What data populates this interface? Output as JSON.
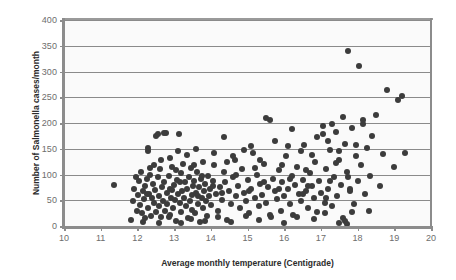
{
  "chart_data": {
    "type": "scatter",
    "title": "",
    "xlabel": "Average monthly temperature (Centigrade)",
    "ylabel": "Number of Salmonella cases/month",
    "xlim": [
      10,
      20
    ],
    "ylim": [
      0,
      400
    ],
    "xticks": [
      10,
      11,
      12,
      13,
      14,
      15,
      16,
      17,
      18,
      19,
      20
    ],
    "yticks": [
      0,
      50,
      100,
      150,
      200,
      250,
      300,
      350,
      400
    ],
    "grid": "horizontal",
    "legend": "none",
    "marker_color": "#3c3c3c",
    "marker_size": 6,
    "gridline_color": "#8a8a8a",
    "axis_color": "#8c8c8c",
    "plot_background": "#fafafa",
    "series": [
      {
        "name": "Monthly Salmonella cases vs temperature",
        "points": [
          [
            11.35,
            80
          ],
          [
            11.82,
            12
          ],
          [
            11.88,
            48
          ],
          [
            11.92,
            72
          ],
          [
            11.95,
            95
          ],
          [
            11.98,
            30
          ],
          [
            12.02,
            60
          ],
          [
            12.05,
            88
          ],
          [
            12.08,
            40
          ],
          [
            12.1,
            105
          ],
          [
            12.12,
            25
          ],
          [
            12.15,
            68
          ],
          [
            12.18,
            52
          ],
          [
            12.2,
            78
          ],
          [
            12.22,
            15
          ],
          [
            12.25,
            92
          ],
          [
            12.28,
            145
          ],
          [
            12.3,
            35
          ],
          [
            12.32,
            62
          ],
          [
            12.35,
            100
          ],
          [
            12.38,
            20
          ],
          [
            12.4,
            55
          ],
          [
            12.42,
            82
          ],
          [
            12.45,
            44
          ],
          [
            12.48,
            70
          ],
          [
            12.5,
            175
          ],
          [
            12.52,
            28
          ],
          [
            12.55,
            95
          ],
          [
            12.58,
            58
          ],
          [
            12.6,
            38
          ],
          [
            12.62,
            110
          ],
          [
            12.65,
            18
          ],
          [
            12.68,
            75
          ],
          [
            12.7,
            48
          ],
          [
            12.72,
            86
          ],
          [
            12.75,
            30
          ],
          [
            12.78,
            180
          ],
          [
            12.8,
            64
          ],
          [
            12.82,
            42
          ],
          [
            12.85,
            98
          ],
          [
            12.88,
            22
          ],
          [
            12.9,
            72
          ],
          [
            12.92,
            55
          ],
          [
            12.95,
            115
          ],
          [
            12.98,
            35
          ],
          [
            13.0,
            80
          ],
          [
            13.02,
            50
          ],
          [
            13.05,
            10
          ],
          [
            13.08,
            90
          ],
          [
            13.1,
            62
          ],
          [
            13.12,
            178
          ],
          [
            13.15,
            45
          ],
          [
            13.18,
            102
          ],
          [
            13.2,
            28
          ],
          [
            13.22,
            68
          ],
          [
            13.25,
            120
          ],
          [
            13.28,
            55
          ],
          [
            13.3,
            85
          ],
          [
            13.32,
            38
          ],
          [
            13.35,
            72
          ],
          [
            13.38,
            15
          ],
          [
            13.4,
            95
          ],
          [
            13.42,
            48
          ],
          [
            13.45,
            112
          ],
          [
            13.48,
            60
          ],
          [
            13.5,
            32
          ],
          [
            13.52,
            78
          ],
          [
            13.55,
            88
          ],
          [
            13.58,
            25
          ],
          [
            13.6,
            65
          ],
          [
            13.62,
            105
          ],
          [
            13.65,
            42
          ],
          [
            13.68,
            75
          ],
          [
            13.7,
            8
          ],
          [
            13.72,
            92
          ],
          [
            13.75,
            55
          ],
          [
            13.78,
            125
          ],
          [
            13.8,
            35
          ],
          [
            13.82,
            68
          ],
          [
            13.85,
            82
          ],
          [
            13.88,
            48
          ],
          [
            13.9,
            20
          ],
          [
            13.92,
            98
          ],
          [
            13.95,
            58
          ],
          [
            13.98,
            72
          ],
          [
            14.0,
            40
          ],
          [
            14.05,
            88
          ],
          [
            14.1,
            118
          ],
          [
            14.15,
            62
          ],
          [
            14.2,
            30
          ],
          [
            14.25,
            75
          ],
          [
            14.3,
            50
          ],
          [
            14.35,
            105
          ],
          [
            14.4,
            85
          ],
          [
            14.45,
            12
          ],
          [
            14.5,
            68
          ],
          [
            14.55,
            42
          ],
          [
            14.6,
            95
          ],
          [
            14.65,
            128
          ],
          [
            14.7,
            58
          ],
          [
            14.75,
            78
          ],
          [
            14.8,
            35
          ],
          [
            14.85,
            110
          ],
          [
            14.9,
            65
          ],
          [
            14.95,
            48
          ],
          [
            15.0,
            90
          ],
          [
            15.05,
            25
          ],
          [
            15.1,
            72
          ],
          [
            15.15,
            142
          ],
          [
            15.2,
            55
          ],
          [
            15.25,
            100
          ],
          [
            15.3,
            38
          ],
          [
            15.35,
            82
          ],
          [
            15.4,
            60
          ],
          [
            15.45,
            120
          ],
          [
            15.5,
            45
          ],
          [
            15.55,
            75
          ],
          [
            15.6,
            205
          ],
          [
            15.65,
            18
          ],
          [
            15.7,
            92
          ],
          [
            15.75,
            68
          ],
          [
            15.8,
            52
          ],
          [
            15.85,
            108
          ],
          [
            15.9,
            30
          ],
          [
            15.95,
            85
          ],
          [
            16.0,
            58
          ],
          [
            16.05,
            135
          ],
          [
            16.1,
            72
          ],
          [
            16.15,
            42
          ],
          [
            16.2,
            98
          ],
          [
            16.25,
            22
          ],
          [
            16.3,
            80
          ],
          [
            16.35,
            115
          ],
          [
            16.4,
            62
          ],
          [
            16.45,
            48
          ],
          [
            16.5,
            90
          ],
          [
            16.55,
            158
          ],
          [
            16.6,
            68
          ],
          [
            16.65,
            35
          ],
          [
            16.7,
            102
          ],
          [
            16.75,
            78
          ],
          [
            16.8,
            55
          ],
          [
            16.85,
            125
          ],
          [
            16.9,
            28
          ],
          [
            16.95,
            88
          ],
          [
            17.0,
            65
          ],
          [
            17.05,
            195
          ],
          [
            17.1,
            45
          ],
          [
            17.15,
            110
          ],
          [
            17.2,
            72
          ],
          [
            17.25,
            148
          ],
          [
            17.3,
            38
          ],
          [
            17.35,
            95
          ],
          [
            17.4,
            182
          ],
          [
            17.45,
            58
          ],
          [
            17.5,
            128
          ],
          [
            17.55,
            80
          ],
          [
            17.6,
            15
          ],
          [
            17.65,
            160
          ],
          [
            17.7,
            105
          ],
          [
            17.75,
            340
          ],
          [
            17.8,
            68
          ],
          [
            17.85,
            190
          ],
          [
            17.9,
            42
          ],
          [
            17.95,
            135
          ],
          [
            18.0,
            88
          ],
          [
            18.05,
            310
          ],
          [
            18.1,
            118
          ],
          [
            18.15,
            205
          ],
          [
            18.2,
            62
          ],
          [
            18.25,
            152
          ],
          [
            18.3,
            30
          ],
          [
            18.35,
            98
          ],
          [
            18.4,
            175
          ],
          [
            18.5,
            215
          ],
          [
            18.6,
            78
          ],
          [
            18.7,
            140
          ],
          [
            18.8,
            265
          ],
          [
            19.0,
            115
          ],
          [
            19.1,
            245
          ],
          [
            19.2,
            252
          ],
          [
            19.3,
            142
          ],
          [
            12.55,
            178
          ],
          [
            12.72,
            180
          ],
          [
            13.1,
            145
          ],
          [
            14.35,
            172
          ],
          [
            15.5,
            210
          ],
          [
            16.2,
            188
          ],
          [
            16.9,
            172
          ],
          [
            17.05,
            178
          ],
          [
            17.3,
            198
          ],
          [
            17.6,
            212
          ],
          [
            18.15,
            198
          ],
          [
            12.3,
            152
          ],
          [
            13.6,
            150
          ],
          [
            14.6,
            135
          ],
          [
            15.1,
            155
          ],
          [
            15.75,
            165
          ],
          [
            16.45,
            145
          ],
          [
            17.2,
            165
          ],
          [
            17.95,
            158
          ],
          [
            12.9,
            132
          ],
          [
            13.35,
            138
          ],
          [
            14.1,
            142
          ],
          [
            14.9,
            148
          ],
          [
            15.35,
            128
          ],
          [
            16.1,
            155
          ],
          [
            16.75,
            138
          ],
          [
            17.5,
            145
          ],
          [
            12.45,
            118
          ],
          [
            13.05,
            108
          ],
          [
            13.75,
            98
          ],
          [
            14.45,
            125
          ],
          [
            15.2,
            112
          ],
          [
            15.95,
            118
          ],
          [
            16.6,
            108
          ],
          [
            17.4,
            122
          ],
          [
            12.6,
            5
          ],
          [
            13.2,
            6
          ],
          [
            13.85,
            10
          ],
          [
            14.55,
            8
          ],
          [
            15.3,
            12
          ],
          [
            16.0,
            5
          ],
          [
            16.8,
            14
          ],
          [
            17.5,
            6
          ],
          [
            17.65,
            10
          ],
          [
            17.7,
            3
          ],
          [
            12.15,
            8
          ],
          [
            12.85,
            18
          ],
          [
            13.45,
            14
          ],
          [
            14.2,
            18
          ],
          [
            14.95,
            20
          ],
          [
            15.6,
            22
          ],
          [
            16.35,
            18
          ],
          [
            17.1,
            25
          ],
          [
            17.85,
            28
          ],
          [
            12.35,
            112
          ],
          [
            12.65,
            128
          ],
          [
            13.15,
            85
          ],
          [
            13.55,
            118
          ],
          [
            14.05,
            78
          ],
          [
            14.7,
            100
          ],
          [
            15.45,
            85
          ],
          [
            16.15,
            92
          ],
          [
            16.65,
            78
          ],
          [
            17.25,
            88
          ],
          [
            17.75,
            95
          ],
          [
            12.25,
            62
          ],
          [
            12.95,
            70
          ],
          [
            13.65,
            58
          ],
          [
            14.3,
            65
          ],
          [
            15.05,
            68
          ],
          [
            15.85,
            72
          ],
          [
            16.5,
            62
          ],
          [
            17.15,
            55
          ],
          [
            17.8,
            72
          ]
        ]
      }
    ]
  },
  "axes": {
    "y_tick_labels": [
      "400",
      "350",
      "300",
      "250",
      "200",
      "150",
      "100",
      "50",
      "0"
    ],
    "x_tick_labels": [
      "10",
      "11",
      "12",
      "13",
      "14",
      "15",
      "16",
      "17",
      "18",
      "19",
      "20"
    ],
    "y_title": "Number of Salmonella cases/month",
    "x_title": "Average monthly temperature (Centigrade)"
  }
}
